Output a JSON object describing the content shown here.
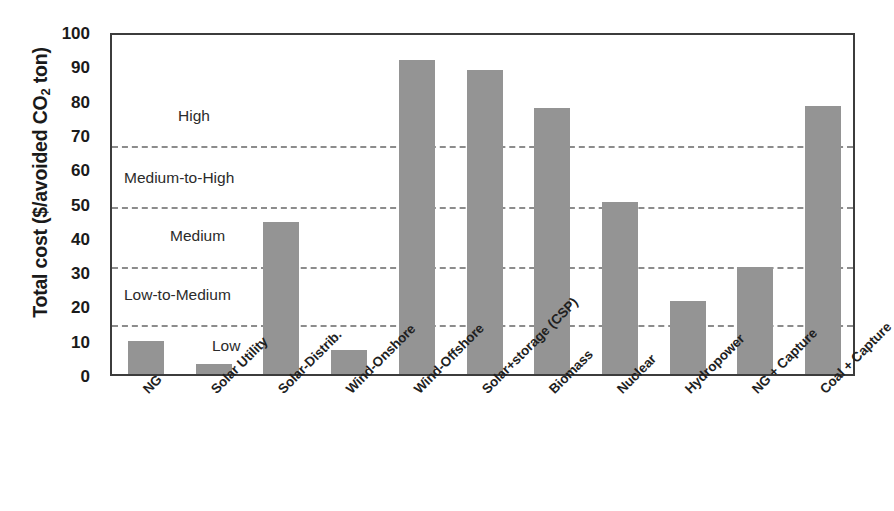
{
  "chart_data": {
    "type": "bar",
    "title": "",
    "xlabel": "",
    "ylabel": "Total cost ($/avoided CO2 ton)",
    "ylabel_parts": {
      "pre": "Total cost ($/avoided CO",
      "sub": "2",
      "post": " ton)"
    },
    "ylim": [
      0,
      100
    ],
    "ytick_labels": [
      "100",
      "90",
      "80",
      "70",
      "60",
      "50",
      "40",
      "30",
      "20",
      "10",
      "0"
    ],
    "ytick_values": [
      100,
      90,
      80,
      70,
      60,
      50,
      40,
      30,
      20,
      10,
      0
    ],
    "grid": false,
    "legend": "none",
    "bar_color": "#949494",
    "categories": [
      "NG",
      "Solar Utility",
      "Solar-Distrib.",
      "Wind-Onshore",
      "Wind-Offshore",
      "Solar+storage (CSP)",
      "Biomass",
      "Nuclear",
      "Hydropower",
      "NG + Capture",
      "Coal + Capture"
    ],
    "values": [
      9.7,
      2.8,
      44.3,
      7.1,
      91.5,
      88.5,
      77.5,
      50.2,
      21.2,
      31.2,
      78.0
    ],
    "annotations": {
      "threshold_lines": [
        {
          "label": "High-threshold",
          "value": 67.5
        },
        {
          "label": "Medium-to-High-threshold",
          "value": 50.0
        },
        {
          "label": "Medium-threshold",
          "value": 32.5
        },
        {
          "label": "Low-threshold",
          "value": 15.5
        }
      ],
      "zone_labels": [
        {
          "text": "High",
          "value": 76
        },
        {
          "text": "Medium-to-High",
          "value": 58
        },
        {
          "text": "Medium",
          "value": 41
        },
        {
          "text": "Low-to-Medium",
          "value": 24
        },
        {
          "text": "Low",
          "value": 9
        }
      ]
    }
  }
}
